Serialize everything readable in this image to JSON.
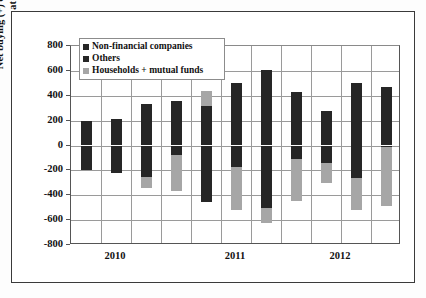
{
  "chart_data": {
    "type": "bar",
    "title": "",
    "subtitle": "",
    "xlabel": "",
    "ylabel": "Net buying (+) or selling (-) $bn by sector at annual rate.",
    "ylim": [
      -800,
      800
    ],
    "ytick_labels": [
      "800",
      "600",
      "400",
      "200",
      "0",
      "-200",
      "-400",
      "-600",
      "-800"
    ],
    "ytick_values": [
      800,
      600,
      400,
      200,
      0,
      -200,
      -400,
      -600,
      -800
    ],
    "grid": true,
    "stacked": true,
    "legend_position": "top-left",
    "x_group_labels": [
      "2010",
      "2011",
      "2012"
    ],
    "categories": [
      "2010Q1",
      "2010Q2",
      "2010Q3",
      "2010Q4",
      "2011Q1",
      "2011Q2",
      "2011Q3",
      "2011Q4",
      "2012Q1",
      "2012Q2",
      "2012Q3"
    ],
    "series": [
      {
        "name": "Non-financial companies",
        "color": "#262626",
        "values": [
          195,
          210,
          330,
          355,
          320,
          505,
          610,
          430,
          280,
          500,
          470
        ]
      },
      {
        "name": "Others",
        "color": "#262626",
        "values": [
          -195,
          -220,
          -250,
          -75,
          -455,
          -170,
          -505,
          -110,
          -140,
          -265,
          -15
        ]
      },
      {
        "name": "Households + mutual funds",
        "color": "#a6a6a6",
        "values": [
          0,
          0,
          -90,
          -290,
          120,
          -345,
          -115,
          -335,
          -160,
          -255,
          -475
        ]
      }
    ],
    "bars": [
      {
        "category": "2010Q1",
        "positive_top": 195,
        "positive_gray_top": null,
        "negative_dark_bottom": -195,
        "negative_gray_bottom": -195
      },
      {
        "category": "2010Q2",
        "positive_top": 210,
        "positive_gray_top": null,
        "negative_dark_bottom": -220,
        "negative_gray_bottom": -220
      },
      {
        "category": "2010Q3",
        "positive_top": 330,
        "positive_gray_top": null,
        "negative_dark_bottom": -250,
        "negative_gray_bottom": -340
      },
      {
        "category": "2010Q4",
        "positive_top": 355,
        "positive_gray_top": null,
        "negative_dark_bottom": -75,
        "negative_gray_bottom": -365
      },
      {
        "category": "2011Q1",
        "positive_top": 320,
        "positive_gray_top": 440,
        "negative_dark_bottom": -455,
        "negative_gray_bottom": -455
      },
      {
        "category": "2011Q2",
        "positive_top": 505,
        "positive_gray_top": null,
        "negative_dark_bottom": -170,
        "negative_gray_bottom": -515
      },
      {
        "category": "2011Q3",
        "positive_top": 610,
        "positive_gray_top": null,
        "negative_dark_bottom": -505,
        "negative_gray_bottom": -620
      },
      {
        "category": "2011Q4",
        "positive_top": 430,
        "positive_gray_top": null,
        "negative_dark_bottom": -110,
        "negative_gray_bottom": -445
      },
      {
        "category": "2012Q1",
        "positive_top": 280,
        "positive_gray_top": null,
        "negative_dark_bottom": -140,
        "negative_gray_bottom": -300
      },
      {
        "category": "2012Q2",
        "positive_top": 500,
        "positive_gray_top": null,
        "negative_dark_bottom": -265,
        "negative_gray_bottom": -520
      },
      {
        "category": "2012Q3",
        "positive_top": 470,
        "positive_gray_top": null,
        "negative_dark_bottom": -15,
        "negative_gray_bottom": -490
      }
    ]
  },
  "legend": {
    "items": [
      {
        "label": "Non-financial companies",
        "color": "#262626"
      },
      {
        "label": "Others",
        "color": "#262626"
      },
      {
        "label": "Households + mutual funds",
        "color": "#a6a6a6"
      }
    ]
  },
  "axis": {
    "y_title": "Net buying (+) or selling (-) $bn by sector at annual rate.",
    "y_ticks": [
      "800",
      "600",
      "400",
      "200",
      "0",
      "-200",
      "-400",
      "-600",
      "-800"
    ],
    "x_labels": [
      "2010",
      "2011",
      "2012"
    ]
  }
}
